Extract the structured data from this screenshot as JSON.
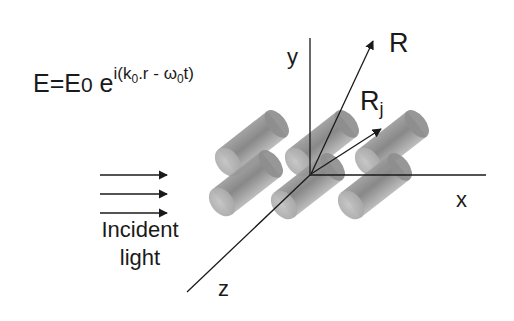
{
  "equation": {
    "lhs": "E=E",
    "e0_sub": "0",
    "base": " e",
    "exp_prefix": "i(k",
    "k_sub": "0",
    "exp_mid": ".r - ω",
    "w_sub": "0",
    "exp_suffix": "t)"
  },
  "incident": {
    "line1": "Incident",
    "line2": "light",
    "arrow_count": 3
  },
  "axes": {
    "x_label": "x",
    "y_label": "y",
    "z_label": "z"
  },
  "vectors": {
    "R_label": "R",
    "Rj_label": "R",
    "Rj_sub": "j"
  },
  "colors": {
    "ink": "#1a1a1a",
    "cylinder_light": "#c8c8c8",
    "cylinder_dark": "#7a7a7a"
  }
}
